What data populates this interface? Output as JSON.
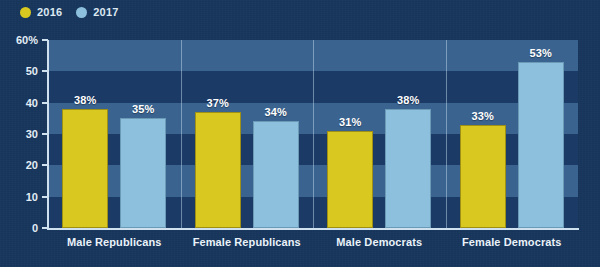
{
  "chart_data": {
    "type": "bar",
    "title": "",
    "xlabel": "",
    "ylabel": "",
    "categories": [
      "Male Republicans",
      "Female Republicans",
      "Male Democrats",
      "Female Democrats"
    ],
    "series": [
      {
        "name": "2016",
        "color": "#d8c81f",
        "values": [
          38,
          37,
          31,
          33
        ],
        "labels": [
          "38%",
          "37%",
          "31%",
          "33%"
        ]
      },
      {
        "name": "2017",
        "color": "#8cc0dc",
        "values": [
          35,
          34,
          38,
          53
        ],
        "labels": [
          "35%",
          "34%",
          "38%",
          "53%"
        ]
      }
    ],
    "ylim": [
      0,
      60
    ],
    "yticks": [
      0,
      10,
      20,
      30,
      40,
      50,
      60
    ],
    "ytick_labels": [
      "0",
      "10",
      "20",
      "30",
      "40",
      "50",
      "60%"
    ],
    "grid": "horizontal-bands",
    "legend_position": "top-left",
    "background_color": "#17365c",
    "plot_background_color": "#1c3a66",
    "band_color": "#3a6390",
    "axis_color": "#cfe0ee",
    "label_color": "#eaf2f9"
  },
  "legend": {
    "items": [
      {
        "label": "2016",
        "color": "#d8c81f",
        "icon": "circle-dot-icon"
      },
      {
        "label": "2017",
        "color": "#8cc0dc",
        "icon": "circle-dot-icon"
      }
    ]
  }
}
